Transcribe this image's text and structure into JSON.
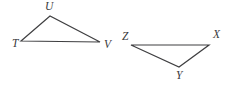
{
  "figure": {
    "background_color": "#ffffff",
    "stroke_color": "#3f3f41",
    "stroke_width": 1.2,
    "label_color": "#3a3a3c",
    "canvas": {
      "width": 232,
      "height": 89
    },
    "triangles": [
      {
        "name": "triangle-TUV",
        "vertices": [
          {
            "label": "T",
            "x": 21,
            "y": 41,
            "label_x": 12,
            "label_y": 38
          },
          {
            "label": "U",
            "x": 50,
            "y": 16,
            "label_x": 45,
            "label_y": 1
          },
          {
            "label": "V",
            "x": 100,
            "y": 42,
            "label_x": 104,
            "label_y": 39
          }
        ],
        "path": "M 21 41 L 50 16 L 100 42 Z"
      },
      {
        "name": "triangle-ZXY",
        "vertices": [
          {
            "label": "Z",
            "x": 131,
            "y": 45,
            "label_x": 122,
            "label_y": 31
          },
          {
            "label": "X",
            "x": 209,
            "y": 45,
            "label_x": 213,
            "label_y": 29
          },
          {
            "label": "Y",
            "x": 179,
            "y": 67,
            "label_x": 176,
            "label_y": 70
          }
        ],
        "path": "M 131 45 L 209 45 L 179 67 Z"
      }
    ]
  }
}
